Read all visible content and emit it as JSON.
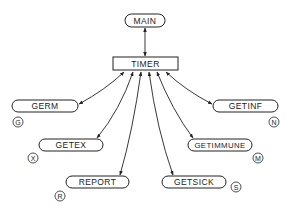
{
  "diagram": {
    "type": "call-graph",
    "nodes": [
      {
        "id": "main",
        "label": "MAIN",
        "shape": "rounded",
        "x": 125,
        "y": 14,
        "w": 40,
        "h": 13
      },
      {
        "id": "timer",
        "label": "TIMER",
        "shape": "rect",
        "x": 113,
        "y": 57,
        "w": 65,
        "h": 13
      },
      {
        "id": "germ",
        "label": "GERM",
        "shape": "rounded",
        "x": 12,
        "y": 100,
        "w": 66,
        "h": 12,
        "tag": "G",
        "tag_x": 18,
        "tag_y": 122
      },
      {
        "id": "getinf",
        "label": "GETINF",
        "shape": "rounded",
        "x": 213,
        "y": 100,
        "w": 65,
        "h": 12,
        "tag": "N",
        "tag_x": 274,
        "tag_y": 122
      },
      {
        "id": "getex",
        "label": "GETEX",
        "shape": "rounded",
        "x": 39,
        "y": 139,
        "w": 64,
        "h": 12,
        "tag": "X",
        "tag_x": 33,
        "tag_y": 158
      },
      {
        "id": "getimmune",
        "label": "GETIMMUNE",
        "shape": "rounded",
        "x": 188,
        "y": 139,
        "w": 64,
        "h": 12,
        "tag": "M",
        "tag_x": 258,
        "tag_y": 158
      },
      {
        "id": "report",
        "label": "REPORT",
        "shape": "rounded",
        "x": 66,
        "y": 176,
        "w": 63,
        "h": 12,
        "tag": "R",
        "tag_x": 60,
        "tag_y": 196
      },
      {
        "id": "getsick",
        "label": "GETSICK",
        "shape": "rounded",
        "x": 162,
        "y": 176,
        "w": 64,
        "h": 12,
        "tag": "S",
        "tag_x": 236,
        "tag_y": 187
      }
    ],
    "edges": [
      {
        "from": "timer",
        "to": "main",
        "direction": "both"
      },
      {
        "from": "timer",
        "to": "germ",
        "direction": "both"
      },
      {
        "from": "timer",
        "to": "getex",
        "direction": "both"
      },
      {
        "from": "timer",
        "to": "report",
        "direction": "both"
      },
      {
        "from": "timer",
        "to": "getsick",
        "direction": "both"
      },
      {
        "from": "timer",
        "to": "getimmune",
        "direction": "both"
      },
      {
        "from": "timer",
        "to": "getinf",
        "direction": "both"
      }
    ],
    "colors": {
      "stroke": "#222222",
      "background": "#ffffff"
    }
  }
}
